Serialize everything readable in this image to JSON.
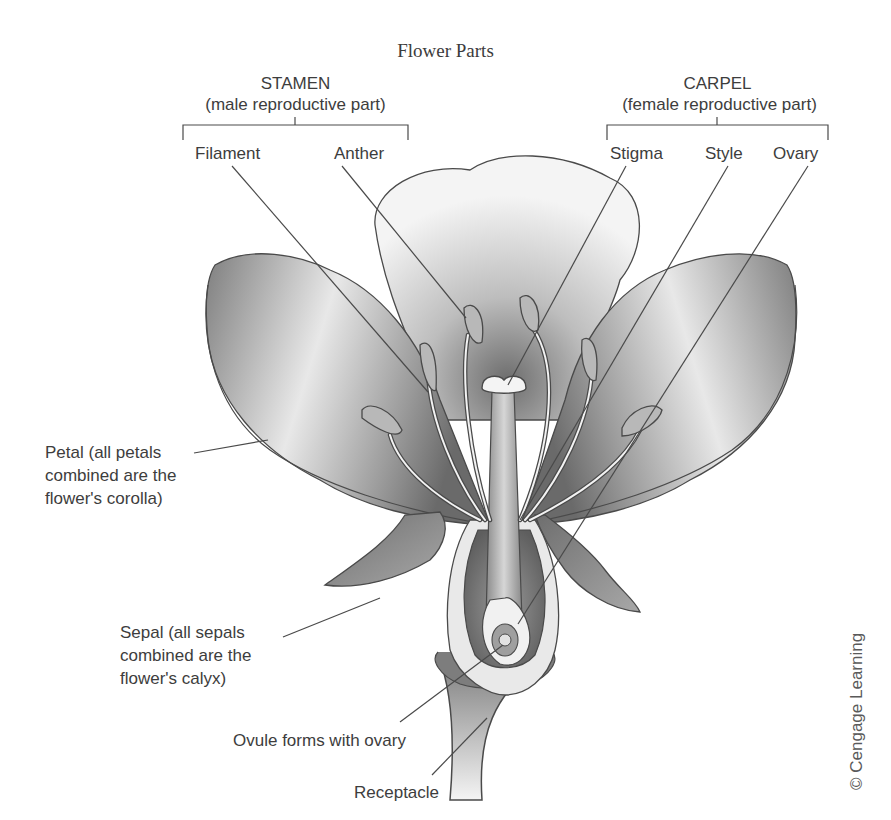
{
  "title": "Flower Parts",
  "groups": {
    "stamen": {
      "heading": "STAMEN",
      "subheading": "(male reproductive part)",
      "parts": [
        "Filament",
        "Anther"
      ]
    },
    "carpel": {
      "heading": "CARPEL",
      "subheading": "(female reproductive part)",
      "parts": [
        "Stigma",
        "Style",
        "Ovary"
      ]
    }
  },
  "labels": {
    "petal": [
      "Petal (all petals",
      "combined are the",
      "flower's corolla)"
    ],
    "sepal": [
      "Sepal (all sepals",
      "combined are the",
      "flower's calyx)"
    ],
    "ovule": "Ovule forms with ovary",
    "receptacle": "Receptacle"
  },
  "credit": "© Cengage Learning",
  "colors": {
    "line": "#4a4a4a",
    "petal_dark": "#8c8c8c",
    "petal_light": "#f2f2f2",
    "text": "#3d3d3d"
  }
}
